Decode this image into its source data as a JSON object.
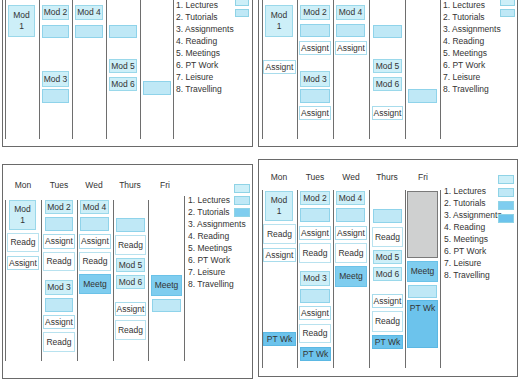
{
  "days": [
    "Mon",
    "Tues",
    "Wed",
    "Thurs",
    "Fri"
  ],
  "legend": [
    "1. Lectures",
    "2. Tutorials",
    "3. Assignments",
    "4. Reading",
    "5. Meetings",
    "6. PT Work",
    "7. Leisure",
    "8. Travelling"
  ],
  "colors": {
    "lectures": "#cdeff8",
    "tutorials": "#bfe8f6",
    "meetings": "#7fcdef",
    "pt_work": "#6cc3ec",
    "leisure": "#cfd0d0"
  },
  "panels": [
    {
      "id": "panel-1",
      "show_days": false,
      "blocks": {
        "mon_mod1": "Mod\n1",
        "tue_mod2": "Mod 2",
        "tue_mod3": "Mod 3",
        "wed_mod4": "Mod 4",
        "thu_mod5": "Mod 5",
        "thu_mod6": "Mod 6"
      }
    },
    {
      "id": "panel-2",
      "show_days": false,
      "blocks": {
        "mon_mod1": "Mod\n1",
        "mon_assign": "Assignt",
        "tue_mod2": "Mod 2",
        "tue_assign1": "Assignt",
        "tue_mod3": "Mod 3",
        "tue_assign2": "Assignt",
        "wed_mod4": "Mod 4",
        "wed_assign": "Assignt",
        "thu_mod5": "Mod 5",
        "thu_mod6": "Mod 6",
        "thu_assign": "Assignt"
      }
    },
    {
      "id": "panel-3",
      "show_days": true,
      "blocks": {
        "mon_mod1": "Mod\n1",
        "mon_readg": "Readg",
        "mon_assign": "Assignt",
        "tue_mod2": "Mod 2",
        "tue_assign1": "Assignt",
        "tue_readg1": "Readg",
        "tue_mod3": "Mod 3",
        "tue_assign2": "Assignt",
        "tue_readg2": "Readg",
        "wed_mod4": "Mod 4",
        "wed_assign": "Assignt",
        "wed_readg": "Readg",
        "wed_meetg": "Meetg",
        "thu_readg1": "Readg",
        "thu_mod5": "Mod 5",
        "thu_mod6": "Mod 6",
        "thu_assign": "Assignt",
        "thu_readg2": "Readg",
        "fri_meetg": "Meetg"
      }
    },
    {
      "id": "panel-4",
      "show_days": true,
      "blocks": {
        "mon_mod1": "Mod\n1",
        "mon_readg": "Readg",
        "mon_assign": "Assignt",
        "mon_ptwk": "PT Wk",
        "tue_mod2": "Mod 2",
        "tue_assign1": "Assignt",
        "tue_readg1": "Readg",
        "tue_mod3": "Mod 3",
        "tue_assign2": "Assignt",
        "tue_readg2": "Readg",
        "tue_ptwk": "PT Wk",
        "wed_mod4": "Mod 4",
        "wed_assign": "Assignt",
        "wed_readg": "Readg",
        "wed_meetg": "Meetg",
        "thu_readg1": "Readg",
        "thu_mod5": "Mod 5",
        "thu_mod6": "Mod 6",
        "thu_assign": "Assignt",
        "thu_readg2": "Readg",
        "thu_ptwk": "PT Wk",
        "fri_meetg": "Meetg",
        "fri_ptwk": "PT Wk"
      }
    }
  ]
}
